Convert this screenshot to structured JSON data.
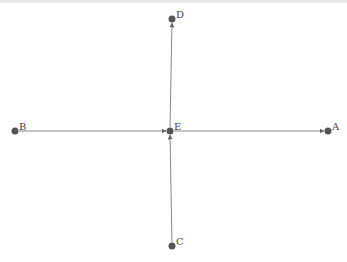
{
  "diagram": {
    "type": "graph",
    "nodes": [
      {
        "id": "A",
        "label": "A"
      },
      {
        "id": "B",
        "label": "B"
      },
      {
        "id": "C",
        "label": "C"
      },
      {
        "id": "D",
        "label": "D"
      },
      {
        "id": "E",
        "label": "E"
      }
    ],
    "edges": [
      {
        "from": "E",
        "to": "A",
        "directed": true
      },
      {
        "from": "B",
        "to": "E",
        "directed": true
      },
      {
        "from": "E",
        "to": "D",
        "directed": true
      },
      {
        "from": "C",
        "to": "E",
        "directed": true
      }
    ],
    "colors": {
      "node": "#555555",
      "edge": "#888888",
      "label": "#444444"
    }
  }
}
